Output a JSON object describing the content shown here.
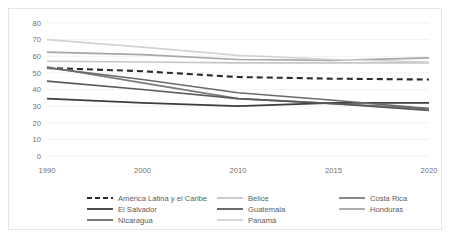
{
  "chart_data": {
    "type": "line",
    "title": "",
    "subtitle": "",
    "xlabel": "",
    "ylabel": "",
    "x": [
      1990,
      2000,
      2010,
      2015,
      2020
    ],
    "x_tick_labels": [
      "1990",
      "2000",
      "2010",
      "2015",
      "2020"
    ],
    "y_tick_labels": [
      "0",
      "10",
      "20",
      "30",
      "40",
      "50",
      "60",
      "70",
      "80"
    ],
    "ylim": [
      0,
      80
    ],
    "y_ticks": [
      0,
      10,
      20,
      30,
      40,
      50,
      60,
      70,
      80
    ],
    "grid": "horizontal",
    "legend_position": "bottom",
    "series": [
      {
        "name": "América Latina y el Caribe",
        "values": [
          53.0,
          51.0,
          47.5,
          46.5,
          46.0
        ],
        "color": "#2b2b2b",
        "dash": "dashed",
        "width": 2.1
      },
      {
        "name": "Belice",
        "values": [
          57.0,
          56.5,
          56.0,
          56.0,
          56.0
        ],
        "color": "#c6c6c6",
        "dash": "solid",
        "width": 1.6
      },
      {
        "name": "Costa Rica",
        "values": [
          53.5,
          44.0,
          34.5,
          31.5,
          28.5
        ],
        "color": "#7b7b7b",
        "dash": "solid",
        "width": 1.6
      },
      {
        "name": "El Salvador",
        "values": [
          34.5,
          32.0,
          30.0,
          32.0,
          32.0
        ],
        "color": "#3d3d3d",
        "dash": "solid",
        "width": 1.7
      },
      {
        "name": "Guatemala",
        "values": [
          45.0,
          40.0,
          34.5,
          31.5,
          27.5
        ],
        "color": "#5a5a5a",
        "dash": "solid",
        "width": 1.7
      },
      {
        "name": "Honduras",
        "values": [
          62.5,
          61.0,
          58.0,
          57.5,
          59.0
        ],
        "color": "#a7a7a7",
        "dash": "solid",
        "width": 1.6
      },
      {
        "name": "Nicaragua",
        "values": [
          53.0,
          46.0,
          38.0,
          33.5,
          28.5
        ],
        "color": "#6a6a6a",
        "dash": "solid",
        "width": 1.6
      },
      {
        "name": "Panamá",
        "values": [
          70.0,
          65.5,
          60.5,
          58.0,
          56.5
        ],
        "color": "#d3d3d3",
        "dash": "solid",
        "width": 1.6
      }
    ],
    "legend_rows": [
      [
        "América Latina y el Caribe",
        "Belice",
        "Costa Rica"
      ],
      [
        "El Salvador",
        "Guatemala",
        "Honduras"
      ],
      [
        "Nicaragua",
        "Panamá"
      ]
    ]
  }
}
